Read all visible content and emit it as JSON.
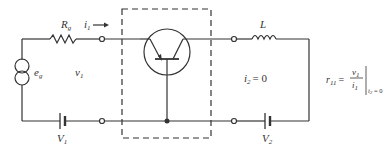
{
  "diagram": {
    "type": "circuit",
    "labels": {
      "source": "e",
      "source_sub": "g",
      "resistor": "R",
      "resistor_sub": "g",
      "input_current": "i",
      "input_current_sub": "1",
      "input_voltage": "v",
      "input_voltage_sub": "1",
      "battery1": "V",
      "battery1_sub": "1",
      "inductor": "L",
      "output_current": "i",
      "output_current_sub": "2",
      "output_current_eq": "= 0",
      "battery2": "V",
      "battery2_sub": "2"
    },
    "formula": {
      "lhs": "r",
      "lhs_sub": "11",
      "equals": "=",
      "numerator": "v",
      "numerator_sub": "1",
      "denominator": "i",
      "denominator_sub": "1",
      "condition": "i",
      "condition_sub": "2",
      "condition_eq": " = 0"
    },
    "colors": {
      "line": "#333333",
      "background": "#ffffff"
    }
  }
}
